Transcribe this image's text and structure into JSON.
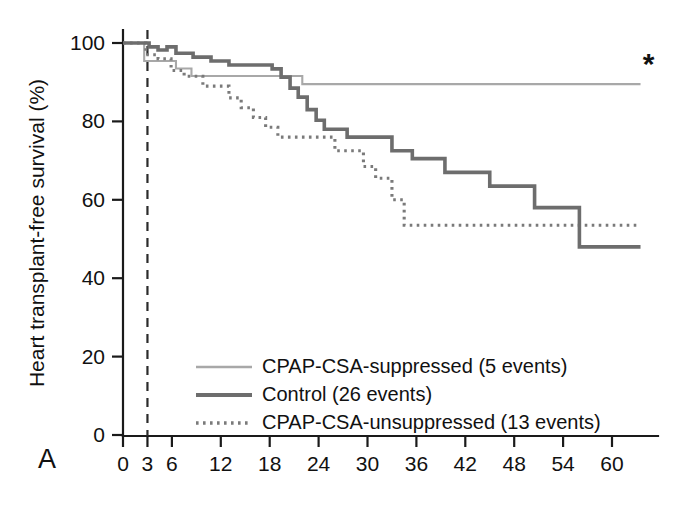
{
  "figure": {
    "panel_label": "A",
    "annotation": "*"
  },
  "chart_data": {
    "type": "line",
    "title": "",
    "xlabel": "",
    "ylabel": "Heart transplant-free survival (%)",
    "xlim": [
      0,
      64
    ],
    "ylim": [
      0,
      100
    ],
    "grid": false,
    "legend_position": "center",
    "x_ticks": [
      0,
      3,
      6,
      12,
      18,
      24,
      30,
      36,
      42,
      48,
      54,
      60
    ],
    "x_tick_labels": [
      "0",
      "3",
      "6",
      "12",
      "18",
      "24",
      "30",
      "36",
      "42",
      "48",
      "54",
      "60"
    ],
    "y_ticks": [
      0,
      20,
      40,
      60,
      80,
      100
    ],
    "y_tick_labels": [
      "0",
      "20",
      "40",
      "60",
      "80",
      "100"
    ],
    "reference_line": {
      "x": 3,
      "style": "dashed",
      "label": ""
    },
    "annotations": [
      {
        "text": "*",
        "x": 64.5,
        "y": 92,
        "series": "CPAP-CSA-suppressed"
      }
    ],
    "series": [
      {
        "name": "CPAP-CSA-suppressed (5 events)",
        "label": "CPAP-CSA-suppressed",
        "events": 5,
        "style": "solid-light",
        "color": "#a8a8a8",
        "steps": [
          [
            0,
            100
          ],
          [
            2.6,
            100
          ],
          [
            2.6,
            95.4
          ],
          [
            6.5,
            95.4
          ],
          [
            6.5,
            93.5
          ],
          [
            8.4,
            93.5
          ],
          [
            8.4,
            91.6
          ],
          [
            22.0,
            91.6
          ],
          [
            22.0,
            89.5
          ],
          [
            63.5,
            89.5
          ]
        ]
      },
      {
        "name": "Control (26 events)",
        "label": "Control",
        "events": 26,
        "style": "solid-dark",
        "color": "#6d6d6d",
        "steps": [
          [
            0,
            100
          ],
          [
            3.2,
            100
          ],
          [
            3.2,
            99.0
          ],
          [
            4.3,
            99.0
          ],
          [
            4.3,
            98.2
          ],
          [
            5.4,
            98.2
          ],
          [
            5.4,
            99.0
          ],
          [
            6.5,
            99.0
          ],
          [
            6.5,
            97.4
          ],
          [
            8.6,
            97.4
          ],
          [
            8.6,
            96.4
          ],
          [
            10.8,
            96.4
          ],
          [
            10.8,
            95.4
          ],
          [
            13.0,
            95.4
          ],
          [
            13.0,
            94.4
          ],
          [
            18.3,
            94.4
          ],
          [
            18.3,
            93.4
          ],
          [
            19.4,
            93.4
          ],
          [
            19.4,
            91.3
          ],
          [
            20.5,
            91.3
          ],
          [
            20.5,
            88.5
          ],
          [
            21.5,
            88.5
          ],
          [
            21.5,
            86.2
          ],
          [
            22.6,
            86.2
          ],
          [
            22.6,
            83.0
          ],
          [
            23.7,
            83.0
          ],
          [
            23.7,
            80.3
          ],
          [
            24.7,
            80.3
          ],
          [
            24.7,
            78.0
          ],
          [
            27.5,
            78.0
          ],
          [
            27.5,
            76.0
          ],
          [
            33.0,
            76.0
          ],
          [
            33.0,
            72.5
          ],
          [
            35.5,
            72.5
          ],
          [
            35.5,
            70.5
          ],
          [
            39.5,
            70.5
          ],
          [
            39.5,
            67.0
          ],
          [
            45.0,
            67.0
          ],
          [
            45.0,
            63.5
          ],
          [
            50.5,
            63.5
          ],
          [
            50.5,
            58.0
          ],
          [
            56.0,
            58.0
          ],
          [
            56.0,
            48.0
          ],
          [
            63.5,
            48.0
          ]
        ]
      },
      {
        "name": "CPAP-CSA-unsuppressed (13 events)",
        "label": "CPAP-CSA-unsuppressed",
        "events": 13,
        "style": "dotted",
        "color": "#7a7a7a",
        "steps": [
          [
            0,
            100
          ],
          [
            2.8,
            100
          ],
          [
            2.8,
            97.0
          ],
          [
            4.3,
            97.0
          ],
          [
            4.3,
            96.0
          ],
          [
            5.9,
            96.0
          ],
          [
            5.9,
            93.0
          ],
          [
            7.5,
            93.0
          ],
          [
            7.5,
            91.5
          ],
          [
            9.8,
            91.5
          ],
          [
            9.8,
            89.0
          ],
          [
            13.0,
            89.0
          ],
          [
            13.0,
            86.0
          ],
          [
            14.5,
            86.0
          ],
          [
            14.5,
            83.5
          ],
          [
            16.0,
            83.5
          ],
          [
            16.0,
            81.0
          ],
          [
            17.5,
            81.0
          ],
          [
            17.5,
            78.5
          ],
          [
            19.0,
            78.5
          ],
          [
            19.0,
            76.0
          ],
          [
            26.0,
            76.0
          ],
          [
            26.0,
            72.5
          ],
          [
            29.5,
            72.5
          ],
          [
            29.5,
            68.5
          ],
          [
            31.0,
            68.5
          ],
          [
            31.0,
            65.5
          ],
          [
            33.0,
            65.5
          ],
          [
            33.0,
            60.0
          ],
          [
            34.5,
            60.0
          ],
          [
            34.5,
            53.5
          ],
          [
            63.5,
            53.5
          ]
        ]
      }
    ]
  },
  "legend": {
    "items": [
      {
        "label": "CPAP-CSA-suppressed (5 events)",
        "style": "solid-light"
      },
      {
        "label": "Control (26 events)",
        "style": "solid-dark"
      },
      {
        "label": "CPAP-CSA-unsuppressed (13 events)",
        "style": "dotted"
      }
    ]
  }
}
